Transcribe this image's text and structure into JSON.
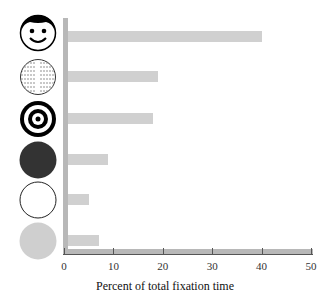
{
  "chart_data": {
    "type": "bar",
    "orientation": "horizontal",
    "title": "",
    "categories": [
      "face",
      "text",
      "bullseye",
      "dark disk",
      "white disk",
      "gray disk"
    ],
    "values": [
      40,
      19,
      18,
      9,
      5,
      7
    ],
    "xlabel": "Percent of total fixation time",
    "ylabel": "",
    "xlim": [
      0,
      50
    ],
    "xticks": [
      "0",
      "10",
      "20",
      "30",
      "40",
      "50"
    ],
    "grid": false,
    "legend": null,
    "bar_color": "#d0d0d0"
  }
}
